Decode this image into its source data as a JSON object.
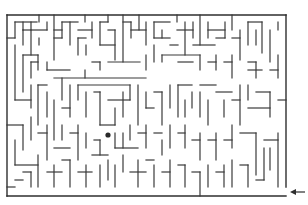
{
  "puzzle": {
    "type": "maze",
    "colors": {
      "wall": "#3a3a3a",
      "background": "#ffffff",
      "goal": "#2a2a2a"
    },
    "frame": {
      "left": 7,
      "top": 15,
      "right": 286,
      "bottom": 196
    },
    "entrance": {
      "side": "right",
      "opening_y_from": 187,
      "opening_y_to": 196
    },
    "entrance_arrow": {
      "direction": "left",
      "x1": 305,
      "x2": 290,
      "y": 192,
      "icon": "arrow-left-icon"
    },
    "goal_dot": {
      "cx": 108,
      "cy": 135,
      "r": 2.6
    },
    "walls": [
      [
        7,
        15,
        286,
        15
      ],
      [
        7,
        15,
        7,
        196
      ],
      [
        7,
        196,
        286,
        196
      ],
      [
        286,
        15,
        286,
        187
      ],
      [
        7,
        38,
        15,
        38
      ],
      [
        15,
        22,
        15,
        38
      ],
      [
        15,
        22,
        37,
        22
      ],
      [
        23,
        22,
        23,
        30
      ],
      [
        31,
        22,
        31,
        30
      ],
      [
        39,
        15,
        39,
        22
      ],
      [
        15,
        45,
        15,
        100
      ],
      [
        23,
        30,
        23,
        45
      ],
      [
        23,
        30,
        47,
        30
      ],
      [
        31,
        30,
        31,
        55
      ],
      [
        39,
        38,
        39,
        45
      ],
      [
        47,
        22,
        47,
        30
      ],
      [
        54,
        15,
        54,
        60
      ],
      [
        54,
        30,
        62,
        30
      ],
      [
        62,
        22,
        62,
        38
      ],
      [
        62,
        22,
        78,
        22
      ],
      [
        70,
        22,
        70,
        45
      ],
      [
        54,
        38,
        62,
        38
      ],
      [
        85,
        15,
        85,
        22
      ],
      [
        78,
        30,
        92,
        30
      ],
      [
        92,
        22,
        92,
        38
      ],
      [
        78,
        38,
        86,
        38
      ],
      [
        78,
        38,
        78,
        55
      ],
      [
        86,
        45,
        86,
        55
      ],
      [
        100,
        22,
        100,
        45
      ],
      [
        100,
        22,
        108,
        22
      ],
      [
        108,
        15,
        108,
        22
      ],
      [
        100,
        45,
        115,
        45
      ],
      [
        115,
        30,
        115,
        60
      ],
      [
        108,
        30,
        115,
        30
      ],
      [
        123,
        15,
        123,
        62
      ],
      [
        123,
        22,
        131,
        22
      ],
      [
        131,
        22,
        131,
        38
      ],
      [
        131,
        30,
        146,
        30
      ],
      [
        139,
        15,
        139,
        30
      ],
      [
        146,
        22,
        146,
        45
      ],
      [
        154,
        22,
        170,
        22
      ],
      [
        154,
        22,
        154,
        38
      ],
      [
        154,
        38,
        170,
        38
      ],
      [
        162,
        30,
        162,
        38
      ],
      [
        177,
        15,
        177,
        22
      ],
      [
        185,
        22,
        185,
        55
      ],
      [
        177,
        30,
        193,
        30
      ],
      [
        193,
        22,
        193,
        38
      ],
      [
        200,
        15,
        200,
        45
      ],
      [
        193,
        45,
        215,
        45
      ],
      [
        208,
        22,
        208,
        38
      ],
      [
        208,
        30,
        225,
        30
      ],
      [
        225,
        22,
        225,
        38
      ],
      [
        216,
        38,
        225,
        38
      ],
      [
        232,
        15,
        232,
        30
      ],
      [
        232,
        38,
        240,
        38
      ],
      [
        240,
        30,
        240,
        60
      ],
      [
        248,
        22,
        262,
        22
      ],
      [
        248,
        22,
        248,
        45
      ],
      [
        256,
        30,
        256,
        45
      ],
      [
        262,
        22,
        262,
        53
      ],
      [
        270,
        30,
        270,
        62
      ],
      [
        278,
        22,
        278,
        30
      ],
      [
        23,
        55,
        38,
        55
      ],
      [
        23,
        55,
        23,
        92
      ],
      [
        31,
        62,
        38,
        62
      ],
      [
        38,
        55,
        38,
        70
      ],
      [
        31,
        62,
        31,
        78
      ],
      [
        47,
        62,
        47,
        70
      ],
      [
        47,
        70,
        70,
        70
      ],
      [
        54,
        78,
        146,
        78
      ],
      [
        62,
        78,
        62,
        100
      ],
      [
        85,
        70,
        85,
        78
      ],
      [
        92,
        62,
        100,
        62
      ],
      [
        100,
        62,
        100,
        70
      ],
      [
        108,
        62,
        140,
        62
      ],
      [
        146,
        55,
        146,
        70
      ],
      [
        154,
        45,
        154,
        62
      ],
      [
        162,
        55,
        162,
        62
      ],
      [
        162,
        55,
        200,
        55
      ],
      [
        170,
        45,
        178,
        45
      ],
      [
        178,
        62,
        193,
        62
      ],
      [
        200,
        55,
        200,
        70
      ],
      [
        208,
        62,
        216,
        62
      ],
      [
        216,
        55,
        216,
        70
      ],
      [
        224,
        62,
        232,
        62
      ],
      [
        232,
        55,
        232,
        78
      ],
      [
        248,
        62,
        256,
        62
      ],
      [
        256,
        62,
        256,
        78
      ],
      [
        248,
        70,
        262,
        70
      ],
      [
        270,
        70,
        278,
        70
      ],
      [
        278,
        55,
        278,
        78
      ],
      [
        15,
        100,
        31,
        100
      ],
      [
        31,
        85,
        31,
        108
      ],
      [
        38,
        85,
        47,
        85
      ],
      [
        38,
        85,
        38,
        125
      ],
      [
        47,
        92,
        47,
        117
      ],
      [
        54,
        100,
        54,
        140
      ],
      [
        62,
        108,
        70,
        108
      ],
      [
        70,
        85,
        70,
        117
      ],
      [
        78,
        85,
        78,
        100
      ],
      [
        78,
        85,
        130,
        85
      ],
      [
        86,
        92,
        86,
        117
      ],
      [
        94,
        92,
        100,
        92
      ],
      [
        100,
        92,
        100,
        125
      ],
      [
        108,
        100,
        130,
        100
      ],
      [
        115,
        108,
        115,
        125
      ],
      [
        123,
        92,
        123,
        117
      ],
      [
        130,
        85,
        130,
        100
      ],
      [
        138,
        85,
        138,
        125
      ],
      [
        146,
        92,
        146,
        108
      ],
      [
        146,
        108,
        154,
        108
      ],
      [
        154,
        92,
        162,
        92
      ],
      [
        162,
        92,
        162,
        125
      ],
      [
        170,
        85,
        170,
        108
      ],
      [
        178,
        85,
        192,
        85
      ],
      [
        178,
        85,
        178,
        117
      ],
      [
        185,
        100,
        185,
        117
      ],
      [
        192,
        92,
        192,
        108
      ],
      [
        200,
        85,
        216,
        85
      ],
      [
        200,
        92,
        200,
        117
      ],
      [
        208,
        100,
        208,
        125
      ],
      [
        216,
        92,
        232,
        92
      ],
      [
        224,
        100,
        224,
        117
      ],
      [
        232,
        100,
        240,
        100
      ],
      [
        240,
        85,
        240,
        125
      ],
      [
        248,
        85,
        248,
        100
      ],
      [
        248,
        108,
        270,
        108
      ],
      [
        256,
        92,
        270,
        92
      ],
      [
        270,
        92,
        270,
        117
      ],
      [
        278,
        100,
        286,
        100
      ],
      [
        7,
        125,
        23,
        125
      ],
      [
        23,
        125,
        23,
        150
      ],
      [
        31,
        117,
        31,
        140
      ],
      [
        38,
        133,
        47,
        133
      ],
      [
        47,
        125,
        47,
        160
      ],
      [
        54,
        148,
        70,
        148
      ],
      [
        62,
        125,
        62,
        140
      ],
      [
        70,
        133,
        78,
        133
      ],
      [
        78,
        125,
        78,
        160
      ],
      [
        86,
        133,
        86,
        148
      ],
      [
        94,
        140,
        100,
        140
      ],
      [
        100,
        140,
        100,
        155
      ],
      [
        100,
        125,
        115,
        125
      ],
      [
        115,
        133,
        115,
        148
      ],
      [
        115,
        148,
        138,
        148
      ],
      [
        123,
        133,
        123,
        148
      ],
      [
        130,
        125,
        130,
        140
      ],
      [
        138,
        133,
        146,
        133
      ],
      [
        146,
        125,
        146,
        148
      ],
      [
        154,
        133,
        162,
        133
      ],
      [
        162,
        140,
        162,
        155
      ],
      [
        170,
        125,
        170,
        148
      ],
      [
        178,
        133,
        185,
        133
      ],
      [
        185,
        125,
        185,
        148
      ],
      [
        192,
        140,
        200,
        140
      ],
      [
        200,
        133,
        200,
        160
      ],
      [
        208,
        140,
        216,
        140
      ],
      [
        216,
        133,
        216,
        160
      ],
      [
        224,
        140,
        232,
        140
      ],
      [
        232,
        125,
        232,
        148
      ],
      [
        240,
        133,
        256,
        133
      ],
      [
        256,
        133,
        256,
        175
      ],
      [
        264,
        140,
        278,
        140
      ],
      [
        278,
        133,
        278,
        187
      ],
      [
        264,
        148,
        264,
        180
      ],
      [
        270,
        148,
        270,
        170
      ],
      [
        15,
        140,
        15,
        165
      ],
      [
        15,
        165,
        38,
        165
      ],
      [
        23,
        172,
        31,
        172
      ],
      [
        31,
        172,
        31,
        187
      ],
      [
        38,
        155,
        38,
        187
      ],
      [
        47,
        172,
        62,
        172
      ],
      [
        54,
        165,
        54,
        187
      ],
      [
        62,
        160,
        70,
        160
      ],
      [
        70,
        160,
        70,
        187
      ],
      [
        78,
        172,
        92,
        172
      ],
      [
        86,
        165,
        86,
        187
      ],
      [
        92,
        155,
        108,
        155
      ],
      [
        100,
        165,
        100,
        187
      ],
      [
        108,
        160,
        108,
        180
      ],
      [
        115,
        165,
        115,
        187
      ],
      [
        123,
        155,
        123,
        172
      ],
      [
        130,
        172,
        146,
        172
      ],
      [
        138,
        160,
        138,
        187
      ],
      [
        146,
        160,
        154,
        160
      ],
      [
        154,
        165,
        154,
        187
      ],
      [
        162,
        172,
        170,
        172
      ],
      [
        170,
        160,
        170,
        187
      ],
      [
        178,
        165,
        185,
        165
      ],
      [
        185,
        165,
        185,
        187
      ],
      [
        192,
        172,
        200,
        172
      ],
      [
        200,
        172,
        200,
        196
      ],
      [
        208,
        165,
        208,
        187
      ],
      [
        216,
        172,
        224,
        172
      ],
      [
        224,
        165,
        224,
        187
      ],
      [
        232,
        160,
        232,
        187
      ],
      [
        240,
        165,
        248,
        165
      ],
      [
        248,
        165,
        248,
        187
      ],
      [
        256,
        180,
        264,
        180
      ],
      [
        15,
        180,
        23,
        180
      ],
      [
        7,
        187,
        15,
        187
      ]
    ]
  }
}
